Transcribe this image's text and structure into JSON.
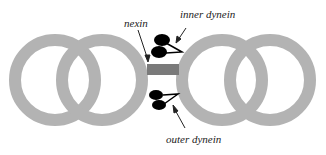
{
  "diagram": {
    "labels": {
      "nexin": "nexin",
      "inner_dynein": "inner dynein",
      "outer_dynein": "outer dynein"
    },
    "colors": {
      "ring": "#b3b3b3",
      "nexin": "#7a7a7a",
      "dynein": "#000000",
      "text": "#222222"
    }
  }
}
